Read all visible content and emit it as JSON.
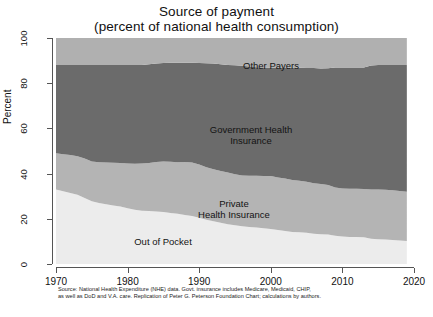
{
  "chart_data": {
    "type": "area",
    "stacked": true,
    "title": "Source of payment",
    "subtitle": "(percent of national health consumption)",
    "xlabel": "",
    "ylabel": "Percent",
    "xlim": [
      1970,
      2020
    ],
    "ylim": [
      0,
      100
    ],
    "grid": false,
    "legend_position": "inline-annotations",
    "xticks": [
      "1970",
      "1980",
      "1990",
      "2000",
      "2010",
      "2020"
    ],
    "xtick_values": [
      1970,
      1980,
      1990,
      2000,
      2010,
      2020
    ],
    "yticks": [
      "0",
      "20",
      "40",
      "60",
      "80",
      "100"
    ],
    "ytick_values": [
      0,
      20,
      40,
      60,
      80,
      100
    ],
    "x": [
      1970,
      1971,
      1972,
      1973,
      1974,
      1975,
      1976,
      1977,
      1978,
      1979,
      1980,
      1981,
      1982,
      1983,
      1984,
      1985,
      1986,
      1987,
      1988,
      1989,
      1990,
      1991,
      1992,
      1993,
      1994,
      1995,
      1996,
      1997,
      1998,
      1999,
      2000,
      2001,
      2002,
      2003,
      2004,
      2005,
      2006,
      2007,
      2008,
      2009,
      2010,
      2011,
      2012,
      2013,
      2014,
      2015,
      2016,
      2017,
      2018,
      2019
    ],
    "series": [
      {
        "name": "Out of Pocket",
        "color": "#ececec",
        "values": [
          33.0,
          32.2,
          31.4,
          30.6,
          29.2,
          27.8,
          27.0,
          26.4,
          25.9,
          25.4,
          24.7,
          24.0,
          23.6,
          23.4,
          23.2,
          23.0,
          22.6,
          22.2,
          21.7,
          21.2,
          20.5,
          19.6,
          18.9,
          18.3,
          17.6,
          17.1,
          16.7,
          16.4,
          16.1,
          15.8,
          15.5,
          15.0,
          14.6,
          14.2,
          14.0,
          13.8,
          13.4,
          13.2,
          13.0,
          12.5,
          12.2,
          12.0,
          11.9,
          11.8,
          11.2,
          11.0,
          10.8,
          10.6,
          10.4,
          10.2
        ]
      },
      {
        "name": "Private Health Insurance",
        "color": "#b4b4b4",
        "values": [
          16.0,
          16.4,
          16.8,
          17.1,
          17.5,
          17.6,
          18.0,
          18.5,
          18.9,
          19.3,
          19.8,
          20.4,
          20.9,
          21.3,
          21.9,
          22.3,
          22.6,
          22.8,
          23.4,
          23.7,
          23.5,
          23.2,
          23.0,
          22.9,
          22.9,
          22.6,
          22.5,
          22.6,
          22.9,
          23.1,
          23.4,
          23.3,
          23.2,
          23.0,
          22.8,
          22.6,
          22.3,
          22.2,
          22.0,
          21.4,
          21.2,
          21.3,
          21.4,
          21.4,
          21.8,
          22.0,
          22.1,
          22.0,
          21.9,
          21.8
        ]
      },
      {
        "name": "Government Health Insurance",
        "color": "#6b6b6b",
        "values": [
          39.0,
          39.4,
          39.8,
          40.3,
          41.3,
          42.6,
          43.0,
          43.2,
          43.3,
          43.4,
          43.6,
          43.7,
          43.6,
          43.7,
          43.6,
          43.6,
          43.8,
          44.0,
          43.9,
          44.1,
          44.9,
          46.0,
          46.8,
          47.2,
          47.6,
          48.2,
          48.5,
          48.4,
          48.1,
          48.0,
          47.9,
          48.5,
          49.1,
          49.6,
          50.0,
          50.3,
          51.0,
          51.1,
          51.6,
          53.0,
          53.5,
          53.6,
          53.6,
          53.7,
          54.8,
          55.0,
          55.2,
          55.5,
          55.8,
          56.0
        ]
      },
      {
        "name": "Other Payers",
        "color": "#b0b0b0",
        "values": [
          12.0,
          12.0,
          12.0,
          12.0,
          12.0,
          12.0,
          12.0,
          11.9,
          11.9,
          11.9,
          11.9,
          11.9,
          11.9,
          11.6,
          11.3,
          11.1,
          11.0,
          11.0,
          11.0,
          11.0,
          11.1,
          11.2,
          11.3,
          11.6,
          11.9,
          12.1,
          12.3,
          12.6,
          12.9,
          13.1,
          13.2,
          13.2,
          13.1,
          13.2,
          13.2,
          13.3,
          13.3,
          13.5,
          13.4,
          13.1,
          13.1,
          13.1,
          13.1,
          13.1,
          12.2,
          12.0,
          11.9,
          11.9,
          11.9,
          12.0
        ]
      }
    ],
    "annotations": [
      {
        "text": "Other Payers",
        "x": 2000,
        "y": 92
      },
      {
        "text": "Government Health\nInsurance",
        "x": 1996,
        "y": 63
      },
      {
        "text": "Private\nHealth Insurance",
        "x": 1993,
        "y": 30
      },
      {
        "text": "Out of Pocket",
        "x": 1981,
        "y": 13
      }
    ],
    "footnote": [
      "Source: National Health Expenditure (NHE) data. Govt. insurance includes Medicare, Medicaid, CHIP,",
      "as well as DoD and V.A. care. Replication of Peter G. Peterson Foundation Chart; calculations by authors."
    ]
  }
}
